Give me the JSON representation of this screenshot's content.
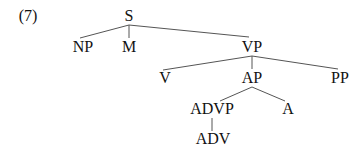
{
  "example_label": "(7)",
  "tree": {
    "nodes": [
      {
        "id": "S",
        "label": "S",
        "x": 129,
        "y": 8
      },
      {
        "id": "NP",
        "label": "NP",
        "x": 83,
        "y": 39
      },
      {
        "id": "M",
        "label": "M",
        "x": 129,
        "y": 39
      },
      {
        "id": "VP",
        "label": "VP",
        "x": 252,
        "y": 39
      },
      {
        "id": "V",
        "label": "V",
        "x": 165,
        "y": 70
      },
      {
        "id": "AP",
        "label": "AP",
        "x": 252,
        "y": 70
      },
      {
        "id": "PP",
        "label": "PP",
        "x": 340,
        "y": 70
      },
      {
        "id": "ADVP",
        "label": "ADVP",
        "x": 212,
        "y": 101
      },
      {
        "id": "A",
        "label": "A",
        "x": 288,
        "y": 101
      },
      {
        "id": "ADV",
        "label": "ADV",
        "x": 213,
        "y": 131
      }
    ],
    "edges": [
      {
        "from": "S",
        "to": "NP"
      },
      {
        "from": "S",
        "to": "M"
      },
      {
        "from": "S",
        "to": "VP"
      },
      {
        "from": "VP",
        "to": "V"
      },
      {
        "from": "VP",
        "to": "AP"
      },
      {
        "from": "VP",
        "to": "PP"
      },
      {
        "from": "AP",
        "to": "ADVP"
      },
      {
        "from": "AP",
        "to": "A"
      },
      {
        "from": "ADVP",
        "to": "ADV"
      }
    ]
  },
  "colors": {
    "text": "#111111",
    "line": "#555555",
    "background": "#ffffff"
  }
}
